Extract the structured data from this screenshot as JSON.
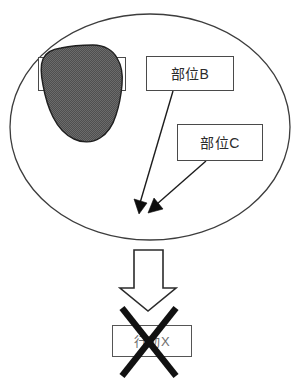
{
  "diagram": {
    "title": "",
    "container": {
      "shape": "ellipse",
      "name": "body-outline-ellipse"
    },
    "blob": {
      "name": "affected-region-blob",
      "fill_color": "#555555",
      "stroke_color": "#1a1a1a"
    },
    "labels": [
      {
        "id": "region-a",
        "text": "部位A",
        "occluded": true,
        "border_color": "#4a4a4a"
      },
      {
        "id": "region-b",
        "text": "部位B",
        "occluded": false,
        "border_color": "#4a4a4a"
      },
      {
        "id": "region-c",
        "text": "部位C",
        "occluded": false,
        "border_color": "#4a4a4a"
      },
      {
        "id": "action-x",
        "text": "行動X",
        "occluded": true,
        "border_color": "#555555"
      }
    ],
    "connectors": [
      {
        "id": "leader-b",
        "from": "region-b",
        "to": "target-point-1",
        "head": "solid-triangle"
      },
      {
        "id": "leader-c",
        "from": "region-c",
        "to": "target-point-2",
        "head": "solid-triangle"
      }
    ],
    "block_arrow": {
      "name": "down-block-arrow",
      "direction": "down",
      "fill_color": "#ffffff",
      "stroke_color": "#2b2b2b"
    },
    "cross_mark": {
      "name": "negation-cross-mark",
      "stroke_color": "#111111",
      "meaning": "crossed-out"
    }
  }
}
